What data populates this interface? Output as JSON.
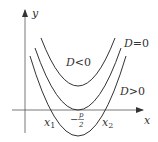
{
  "diagram": {
    "axes": {
      "x_label": "x",
      "y_label": "y"
    },
    "curves": [
      {
        "name": "D<0",
        "label_D": "D",
        "label_rel": "<",
        "label_val": "0"
      },
      {
        "name": "D=0",
        "label_D": "D",
        "label_rel": "=",
        "label_val": "0"
      },
      {
        "name": "D>0",
        "label_D": "D",
        "label_rel": ">",
        "label_val": "0"
      }
    ],
    "x_ticks": {
      "x1": {
        "base": "x",
        "sub": "1"
      },
      "vertex": {
        "minus": "−",
        "num": "p",
        "den": "2"
      },
      "x2": {
        "base": "x",
        "sub": "2"
      }
    },
    "colors": {
      "stroke": "#333333",
      "axis": "#555555"
    }
  }
}
